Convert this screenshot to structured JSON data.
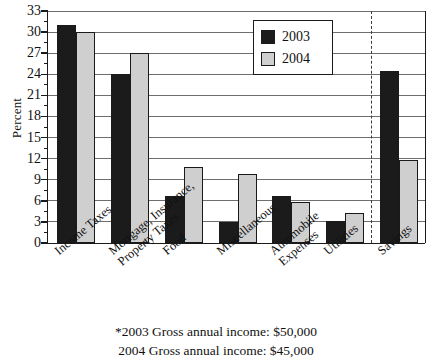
{
  "chart_data": {
    "type": "bar",
    "title": "",
    "xlabel": "",
    "ylabel": "Percent",
    "ylim": [
      0,
      33
    ],
    "ytick_step": 3,
    "yticks": [
      0,
      3,
      6,
      9,
      12,
      15,
      18,
      21,
      24,
      27,
      30,
      33
    ],
    "ytick_labels": [
      "0",
      "3",
      "6",
      "9",
      "12",
      "15",
      "18",
      "21",
      "24",
      "27",
      "30",
      "33"
    ],
    "grid": true,
    "legend_position": "upper-center-right",
    "categories": [
      "Income Taxes",
      "Mortgage, Insurance, Property Taxes",
      "Food",
      "Miscellaneous",
      "Automobile Expenses",
      "Utilities",
      "Savings"
    ],
    "category_lines": [
      [
        "Income Taxes",
        ""
      ],
      [
        "Mortgage, Insurance,",
        "Property Taxes"
      ],
      [
        "Food",
        ""
      ],
      [
        "Miscellaneous",
        ""
      ],
      [
        "Automobile",
        "Expenses"
      ],
      [
        "Utilities",
        ""
      ],
      [
        "Savings",
        ""
      ]
    ],
    "series": [
      {
        "name": "2003",
        "color": "#1b1b1b",
        "values": [
          31.0,
          24.0,
          6.7,
          3.0,
          6.7,
          3.2,
          24.5
        ]
      },
      {
        "name": "2004",
        "color": "#cfcfcf",
        "values": [
          30.0,
          27.0,
          10.8,
          9.8,
          5.8,
          4.3,
          11.8
        ]
      }
    ],
    "annotations": {
      "divider": {
        "style": "dashed-vertical",
        "before_category": "Savings"
      }
    }
  },
  "legend": {
    "entries": [
      {
        "label": "2003",
        "swatch": "black-square"
      },
      {
        "label": "2004",
        "swatch": "gray-square"
      }
    ]
  },
  "footnote": {
    "line1": "*2003 Gross annual income:  $50,000",
    "line2": "2004 Gross annual income:  $45,000"
  },
  "colors": {
    "series_2003": "#1b1b1b",
    "series_2004": "#cfcfcf",
    "axis": "#1a1a1a",
    "grid": "#6e6e6e",
    "background": "#ffffff"
  }
}
